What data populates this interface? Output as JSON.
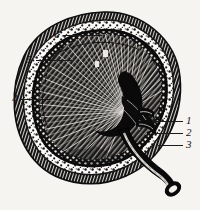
{
  "figure": {
    "style": "black-and-white line engraving",
    "background_color": "#f6f4f1",
    "ink_color": "#1b1b1b",
    "width": 200,
    "height": 210
  },
  "callouts": [
    {
      "id": "callout-1",
      "label": "1",
      "x": 186,
      "y": 115,
      "leader_x": 152,
      "leader_y": 121,
      "leader_w": 31,
      "target": "renal-artery"
    },
    {
      "id": "callout-2",
      "label": "2",
      "x": 186,
      "y": 127,
      "leader_x": 152,
      "leader_y": 133,
      "leader_w": 31,
      "target": "renal-vein"
    },
    {
      "id": "callout-3",
      "label": "3",
      "x": 186,
      "y": 139,
      "leader_x": 158,
      "leader_y": 145,
      "leader_w": 25,
      "target": "ureter"
    },
    {
      "id": "callout-4",
      "label": "4",
      "x": 12,
      "y": 93,
      "leader_x": 21,
      "leader_y": 99,
      "leader_w": 30,
      "target": "renal-column-boundary"
    },
    {
      "id": "callout-5",
      "label": "5",
      "x": 27,
      "y": 54,
      "leader_x": 36,
      "leader_y": 60,
      "leader_w": 38,
      "target": "renal-cortex"
    },
    {
      "id": "callout-6",
      "label": "6",
      "x": 54,
      "y": 29,
      "leader_x": 63,
      "leader_y": 35,
      "leader_w": 39,
      "target": "fibrous-capsule"
    }
  ],
  "structures": [
    {
      "name": "fibrous-capsule",
      "description": "outer dark rim of the kidney"
    },
    {
      "name": "renal-cortex",
      "description": "stippled granular outer zone"
    },
    {
      "name": "renal-medulla",
      "description": "radially striated inner zone with pyramids"
    },
    {
      "name": "renal-pelvis",
      "description": "dark funnel-shaped cavity at the hilum"
    },
    {
      "name": "renal-artery",
      "description": "vessel entering at the hilum"
    },
    {
      "name": "renal-vein",
      "description": "vessel leaving at the hilum"
    },
    {
      "name": "ureter",
      "description": "tube descending from the pelvis with open lumen"
    }
  ]
}
